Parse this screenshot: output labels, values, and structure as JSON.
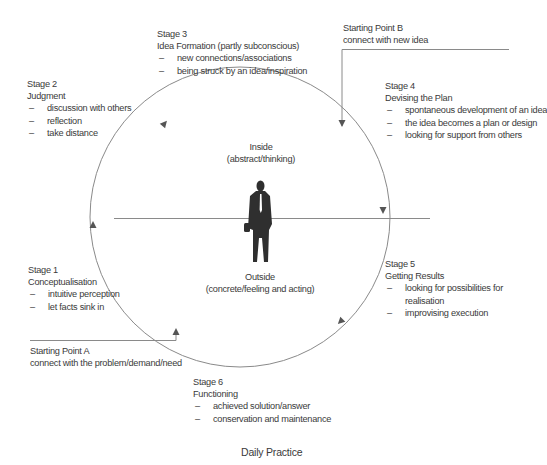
{
  "colors": {
    "line": "#8a8a8a",
    "arrow": "#555555",
    "text": "#3a3a3a",
    "figure": "#2f2f2f"
  },
  "stages": [
    {
      "id": "stage1",
      "label": "Stage 1",
      "title": "Conceptualisation",
      "items": [
        "intuitive perception",
        "let facts sink in"
      ]
    },
    {
      "id": "stage2",
      "label": "Stage 2",
      "title": "Judgment",
      "items": [
        "discussion with others",
        "reflection",
        "take distance"
      ]
    },
    {
      "id": "stage3",
      "label": "Stage 3",
      "title": "Idea Formation (partly subconscious)",
      "items": [
        "new connections/associations",
        "being struck by an idea/inspiration"
      ]
    },
    {
      "id": "stage4",
      "label": "Stage 4",
      "title": "Devising the Plan",
      "items": [
        "spontaneous development of an idea",
        "the idea becomes a plan or design",
        "looking for support from others"
      ]
    },
    {
      "id": "stage5",
      "label": "Stage 5",
      "title": "Getting Results",
      "items": [
        "looking for possibilities for",
        "realisation",
        "improvising execution"
      ]
    },
    {
      "id": "stage6",
      "label": "Stage 6",
      "title": "Functioning",
      "items": [
        "achieved solution/answer",
        "conservation and maintenance"
      ]
    }
  ],
  "starting_points": {
    "a": {
      "label": "Starting Point A",
      "text": "connect with the problem/demand/need"
    },
    "b": {
      "label": "Starting Point B",
      "text": "connect with new idea"
    }
  },
  "center": {
    "inside_title": "Inside",
    "inside_sub": "(abstract/thinking)",
    "outside_title": "Outside",
    "outside_sub": "(concrete/feeling and acting)",
    "figure_icon": "person-silhouette-icon"
  },
  "footer": {
    "title": "Daily Practice"
  }
}
